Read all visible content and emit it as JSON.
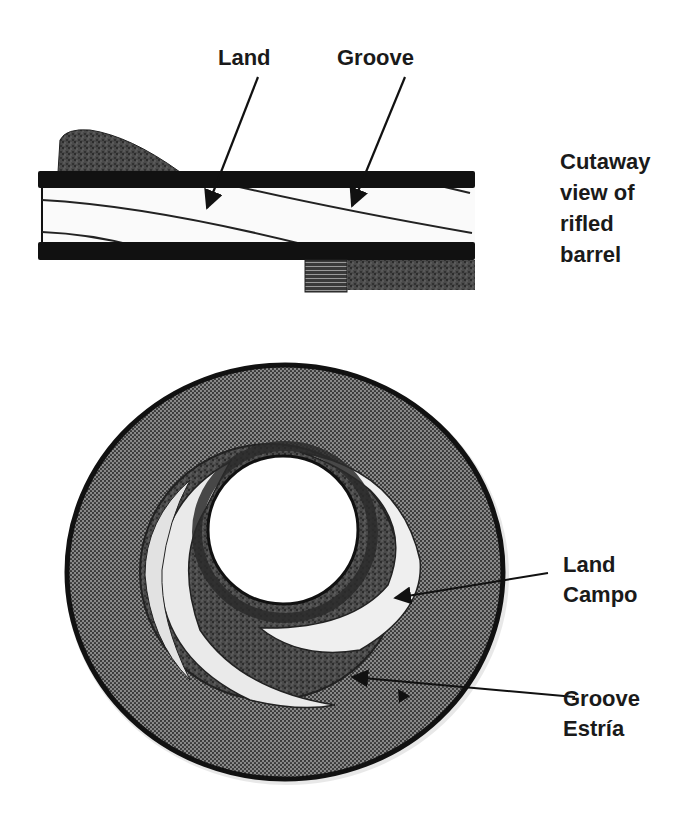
{
  "figure": {
    "colors": {
      "background": "#ffffff",
      "outline": "#111111",
      "halftone_fill": "#6b6b6b",
      "dark_fill": "#3a3a3a",
      "bore_light": "#f4f4f4",
      "text": "#1a1a1a"
    }
  },
  "cutaway": {
    "labels": {
      "land": "Land",
      "groove": "Groove"
    },
    "caption_lines": [
      "Cutaway",
      "view of",
      "rifled",
      "barrel"
    ]
  },
  "cross_section": {
    "land_label": {
      "en": "Land",
      "es": "Campo"
    },
    "groove_label": {
      "en": "Groove",
      "es": "Estría"
    }
  }
}
